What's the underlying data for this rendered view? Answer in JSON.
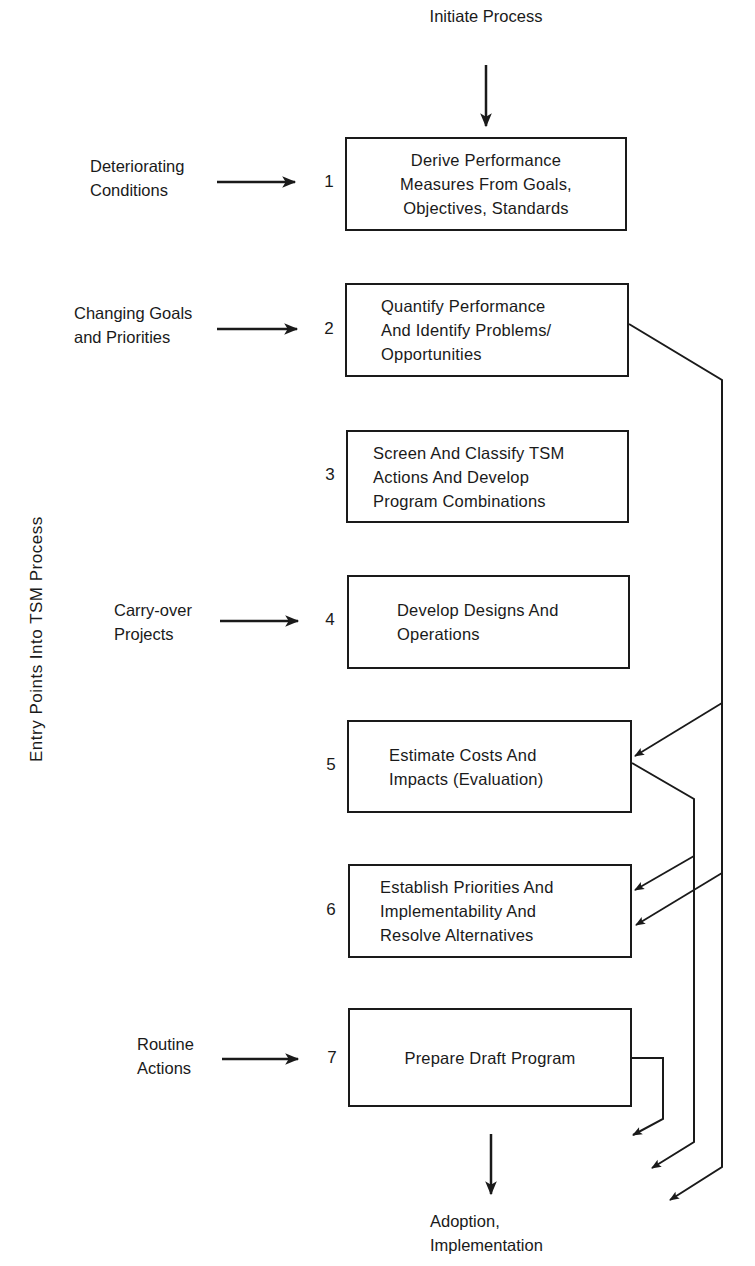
{
  "diagram": {
    "top_label": "Initiate Process",
    "bottom_label": "Adoption,\nImplementation",
    "side_label": "Entry Points Into TSM Process",
    "steps": [
      {
        "number": "1",
        "text": "Derive Performance\nMeasures From Goals,\nObjectives, Standards"
      },
      {
        "number": "2",
        "text": "Quantify Performance\nAnd Identify Problems/\nOpportunities"
      },
      {
        "number": "3",
        "text": "Screen And Classify TSM\nActions And Develop\nProgram Combinations"
      },
      {
        "number": "4",
        "text": "Develop Designs And\nOperations"
      },
      {
        "number": "5",
        "text": "Estimate Costs And\nImpacts (Evaluation)"
      },
      {
        "number": "6",
        "text": "Establish Priorities And\nImplementability And\nResolve Alternatives"
      },
      {
        "number": "7",
        "text": "Prepare Draft Program"
      }
    ],
    "entry_points": [
      {
        "label": "Deteriorating\nConditions",
        "target_step": "1"
      },
      {
        "label": "Changing Goals\nand Priorities",
        "target_step": "2"
      },
      {
        "label": "Carry-over\nProjects",
        "target_step": "4"
      },
      {
        "label": "Routine\nActions",
        "target_step": "7"
      }
    ],
    "line_color": "#1a1a1a"
  }
}
